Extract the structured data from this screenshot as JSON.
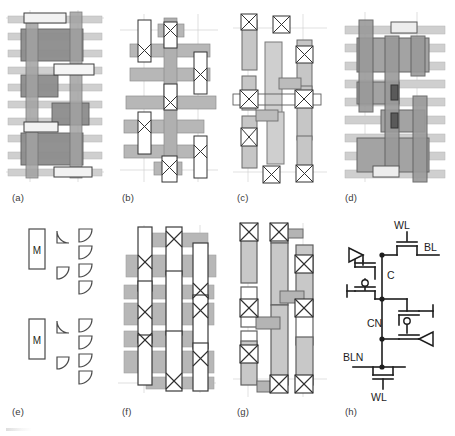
{
  "figure": {
    "type": "multi-panel-layout-figure",
    "panel_count": 8,
    "captions": [
      {
        "key": "a",
        "label": "(a)",
        "x": 12,
        "y": 196
      },
      {
        "key": "b",
        "label": "(b)",
        "x": 122,
        "y": 196
      },
      {
        "key": "c",
        "label": "(c)",
        "x": 237,
        "y": 196
      },
      {
        "key": "d",
        "label": "(d)",
        "x": 345,
        "y": 196
      },
      {
        "key": "e",
        "label": "(e)",
        "x": 12,
        "y": 410
      },
      {
        "key": "f",
        "label": "(f)",
        "x": 122,
        "y": 410
      },
      {
        "key": "g",
        "label": "(g)",
        "x": 237,
        "y": 410
      },
      {
        "key": "h",
        "label": "(h)",
        "x": 345,
        "y": 410
      }
    ],
    "panels": {
      "a": {
        "name": "layout-mask-a",
        "description": "Diffusion and poly layout with contacts"
      },
      "b": {
        "name": "layout-mask-b",
        "description": "Metal bars with via crosses"
      },
      "c": {
        "name": "layout-mask-c",
        "description": "Sparse metal islands with via crosses"
      },
      "d": {
        "name": "layout-mask-d",
        "description": "Dense diffusion blocks over metal lines"
      },
      "e": {
        "name": "legend-e",
        "description": "Legend with M markers and quarter-circle symbols"
      },
      "f": {
        "name": "layout-mask-f",
        "description": "Metal bars with vertical straps and vias"
      },
      "g": {
        "name": "layout-mask-g",
        "description": "Vertical strap cells with vias"
      },
      "h": {
        "name": "schematic-h",
        "description": "SRAM cell transistor-level schematic"
      }
    },
    "legend_e": {
      "markers": [
        "M",
        "M"
      ],
      "marker_label": "M"
    },
    "schematic_h": {
      "labels": [
        {
          "key": "wl_top",
          "text": "WL",
          "x": 59,
          "y": 14
        },
        {
          "key": "bl",
          "text": "BL",
          "x": 89,
          "y": 36
        },
        {
          "key": "c_node",
          "text": "C",
          "x": 63,
          "y": 65
        },
        {
          "key": "cn_node",
          "text": "CN",
          "x": 45,
          "y": 110
        },
        {
          "key": "bln",
          "text": "BLN",
          "x": 14,
          "y": 127
        },
        {
          "key": "wl_bottom",
          "text": "WL",
          "x": 37,
          "y": 166
        }
      ]
    }
  },
  "colors": {
    "metal_bar": "#b4b4b4",
    "metal_bar_stroke": "#8c8c8c",
    "diffusion": "#9a9a9a",
    "diffusion_dark": "#7d7d7d",
    "poly": "#a8a8a8",
    "light_fill": "#d2d2d2",
    "white_fill": "#ffffff",
    "outline": "#4a4a4a",
    "guide_line": "#c9c9c9",
    "text": "#231f20"
  }
}
